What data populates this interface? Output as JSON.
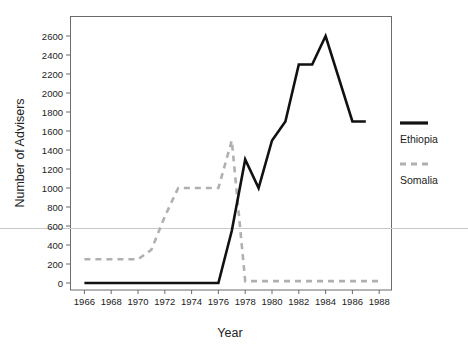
{
  "chart_data": {
    "type": "line",
    "title": "",
    "xlabel": "Year",
    "ylabel": "Number of Advisers",
    "xlim": [
      1965,
      1989
    ],
    "ylim": [
      0,
      2700
    ],
    "grid": false,
    "legend_position": "right",
    "x_ticks": [
      1966,
      1968,
      1970,
      1972,
      1974,
      1976,
      1978,
      1980,
      1982,
      1984,
      1986,
      1988
    ],
    "y_ticks": [
      0,
      200,
      400,
      600,
      800,
      1000,
      1200,
      1400,
      1600,
      1800,
      2000,
      2200,
      2400,
      2600
    ],
    "series": [
      {
        "name": "Ethiopia",
        "style": "solid",
        "color": "#111111",
        "x": [
          1966,
          1967,
          1968,
          1969,
          1970,
          1971,
          1972,
          1973,
          1974,
          1975,
          1976,
          1977,
          1978,
          1979,
          1980,
          1981,
          1982,
          1983,
          1984,
          1986,
          1987
        ],
        "values": [
          0,
          0,
          0,
          0,
          0,
          0,
          0,
          0,
          0,
          0,
          0,
          550,
          1300,
          1000,
          1500,
          1700,
          2300,
          2300,
          2600,
          1700,
          1700
        ]
      },
      {
        "name": "Somalia",
        "style": "dashed",
        "color": "#b0b0b0",
        "x": [
          1966,
          1967,
          1968,
          1969,
          1970,
          1971,
          1972,
          1973,
          1974,
          1975,
          1976,
          1977,
          1978,
          1980,
          1982,
          1984,
          1986,
          1988
        ],
        "values": [
          250,
          250,
          250,
          250,
          250,
          350,
          700,
          1000,
          1000,
          1000,
          1000,
          1500,
          20,
          20,
          20,
          20,
          20,
          20
        ]
      }
    ]
  },
  "axes": {
    "x_title": "Year",
    "y_title": "Number of Advisers",
    "x_tick_labels": [
      "1966",
      "1968",
      "1970",
      "1972",
      "1974",
      "1976",
      "1978",
      "1980",
      "1982",
      "1984",
      "1986",
      "1988"
    ],
    "y_tick_labels": [
      "0",
      "200",
      "400",
      "600",
      "800",
      "1000",
      "1200",
      "1400",
      "1600",
      "1800",
      "2000",
      "2200",
      "2400",
      "2600"
    ]
  },
  "legend": {
    "entries": [
      {
        "label": "Ethiopia",
        "color": "#111111",
        "style": "solid"
      },
      {
        "label": "Somalia",
        "color": "#b0b0b0",
        "style": "dashed"
      }
    ]
  },
  "colors": {
    "ethiopia": "#111111",
    "somalia": "#b0b0b0",
    "frame": "#6b6b6b",
    "text": "#222222",
    "background": "#ffffff",
    "scanline": "#c9c9c9"
  }
}
